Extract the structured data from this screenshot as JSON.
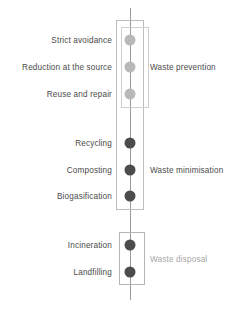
{
  "diagram": {
    "axis": {
      "name": "vertical-axis-line",
      "color": "#9a9a9a"
    },
    "stages": [
      {
        "label": "Strict avoidance",
        "y": 40,
        "tone": "light",
        "dot_color": "#b9b9b9"
      },
      {
        "label": "Reduction at the source",
        "y": 67,
        "tone": "light",
        "dot_color": "#b9b9b9"
      },
      {
        "label": "Reuse and repair",
        "y": 94,
        "tone": "light",
        "dot_color": "#b9b9b9"
      },
      {
        "label": "Recycling",
        "y": 143,
        "tone": "dark",
        "dot_color": "#4c4c4c"
      },
      {
        "label": "Composting",
        "y": 170,
        "tone": "dark",
        "dot_color": "#4c4c4c"
      },
      {
        "label": "Biogasification",
        "y": 196,
        "tone": "dark",
        "dot_color": "#4c4c4c"
      },
      {
        "label": "Incineration",
        "y": 245,
        "tone": "dark",
        "dot_color": "#4c4c4c"
      },
      {
        "label": "Landfilling",
        "y": 272,
        "tone": "dark",
        "dot_color": "#4c4c4c"
      }
    ],
    "categories": [
      {
        "label": "Waste prevention",
        "y": 67,
        "tone": "tone-dark",
        "color": "#4b4b4b"
      },
      {
        "label": "Waste minimisation",
        "y": 170,
        "tone": "tone-dark",
        "color": "#4b4b4b"
      },
      {
        "label": "Waste disposal",
        "y": 259,
        "tone": "tone-light",
        "color": "#a6a6a6"
      }
    ],
    "boxes": [
      {
        "name": "group-box-upper",
        "class": "outer-upper"
      },
      {
        "name": "group-box-prevention",
        "class": "inner-prevention"
      },
      {
        "name": "group-box-disposal",
        "class": "disposal"
      }
    ]
  }
}
